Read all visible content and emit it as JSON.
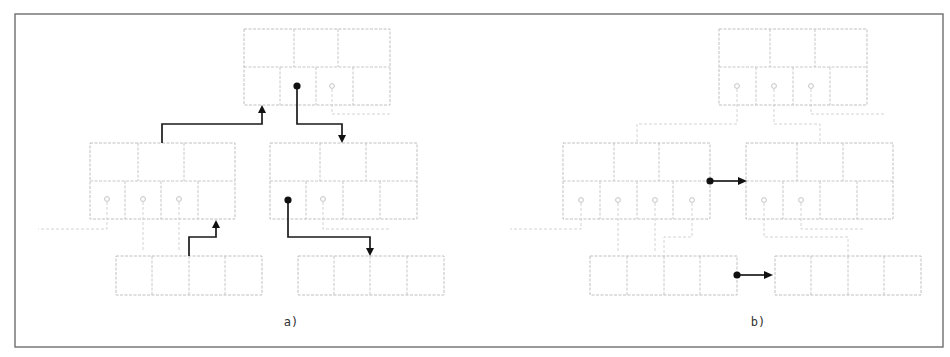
{
  "figure": {
    "width": 950,
    "height": 357,
    "frame": {
      "x": 15,
      "y": 14,
      "w": 928,
      "h": 333
    },
    "colors": {
      "frame": "#6e6e6e",
      "node_border": "#b9b9b9",
      "faint_pointer": "#cfcfcf",
      "bold_pointer": "#111111",
      "caption": "#333333"
    }
  },
  "panels": [
    {
      "id": "a",
      "caption": "a)",
      "caption_pos": {
        "x": 291,
        "y": 326
      },
      "nodes": [
        {
          "id": "a-root",
          "type": "internal",
          "x": 244,
          "y": 29,
          "w": 146,
          "h": 76,
          "split_y": 67,
          "key_splits": [
            294,
            338
          ],
          "ptr_splits": [
            280,
            316,
            353
          ]
        },
        {
          "id": "a-left",
          "type": "internal",
          "x": 90,
          "y": 143,
          "w": 145,
          "h": 76,
          "split_y": 181,
          "key_splits": [
            138,
            184
          ],
          "ptr_splits": [
            125,
            161,
            198
          ]
        },
        {
          "id": "a-right",
          "type": "internal",
          "x": 270,
          "y": 143,
          "w": 147,
          "h": 76,
          "split_y": 181,
          "key_splits": [
            320,
            366
          ],
          "ptr_splits": [
            306,
            343,
            380
          ]
        },
        {
          "id": "a-leaf-1",
          "type": "leaf",
          "x": 116,
          "y": 256,
          "w": 146,
          "h": 39,
          "splits": [
            152,
            189,
            225
          ]
        },
        {
          "id": "a-leaf-2",
          "type": "leaf",
          "x": 298,
          "y": 256,
          "w": 146,
          "h": 39,
          "splits": [
            334,
            370,
            407
          ]
        }
      ],
      "faint_dots": [
        {
          "x": 332,
          "y": 86
        },
        {
          "x": 107,
          "y": 199
        },
        {
          "x": 143,
          "y": 199
        },
        {
          "x": 179,
          "y": 199
        },
        {
          "x": 323,
          "y": 199
        }
      ],
      "faint_paths": [
        "M332 89 L332 114 L392 114",
        "M107 202 L107 229 L38 229",
        "M143 202 L143 252",
        "M179 202 L179 252",
        "M323 202 L323 229 L390 229"
      ],
      "bold_dots": [
        {
          "x": 297,
          "y": 86
        },
        {
          "x": 288,
          "y": 200
        }
      ],
      "bold_arrows": [
        {
          "path": "M162 143 L162 124 L262 124 L262 111",
          "head": {
            "x": 262,
            "y": 105,
            "dir": "up"
          }
        },
        {
          "path": "M297 86 L297 124 L342 124 L342 137",
          "head": {
            "x": 342,
            "y": 143,
            "dir": "down"
          }
        },
        {
          "path": "M189 256 L189 237 L216 237 L216 226",
          "head": {
            "x": 216,
            "y": 220,
            "dir": "up"
          }
        },
        {
          "path": "M288 200 L288 237 L370 237 L370 250",
          "head": {
            "x": 370,
            "y": 256,
            "dir": "down"
          }
        }
      ]
    },
    {
      "id": "b",
      "caption": "b)",
      "caption_pos": {
        "x": 758,
        "y": 326
      },
      "nodes": [
        {
          "id": "b-root",
          "type": "internal",
          "x": 719,
          "y": 29,
          "w": 148,
          "h": 76,
          "split_y": 67,
          "key_splits": [
            770,
            815
          ],
          "ptr_splits": [
            756,
            793,
            830
          ]
        },
        {
          "id": "b-left",
          "type": "internal",
          "x": 563,
          "y": 143,
          "w": 147,
          "h": 76,
          "split_y": 181,
          "key_splits": [
            614,
            659
          ],
          "ptr_splits": [
            600,
            637,
            673
          ]
        },
        {
          "id": "b-right",
          "type": "internal",
          "x": 746,
          "y": 143,
          "w": 147,
          "h": 76,
          "split_y": 181,
          "key_splits": [
            797,
            843
          ],
          "ptr_splits": [
            783,
            820,
            857
          ]
        },
        {
          "id": "b-leaf-1",
          "type": "leaf",
          "x": 590,
          "y": 256,
          "w": 147,
          "h": 39,
          "splits": [
            627,
            664,
            700
          ]
        },
        {
          "id": "b-leaf-2",
          "type": "leaf",
          "x": 775,
          "y": 256,
          "w": 146,
          "h": 39,
          "splits": [
            811,
            848,
            884
          ]
        }
      ],
      "faint_dots": [
        {
          "x": 737,
          "y": 86
        },
        {
          "x": 774,
          "y": 86
        },
        {
          "x": 811,
          "y": 86
        },
        {
          "x": 581,
          "y": 200
        },
        {
          "x": 618,
          "y": 200
        },
        {
          "x": 655,
          "y": 200
        },
        {
          "x": 692,
          "y": 200
        },
        {
          "x": 764,
          "y": 200
        },
        {
          "x": 801,
          "y": 200
        }
      ],
      "faint_paths": [
        "M737 89 L737 124 L637 124 L637 143",
        "M774 89 L774 124 L820 124 L820 143",
        "M811 89 L811 114 L885 114",
        "M581 203 L581 229 L510 229",
        "M618 203 L618 252",
        "M655 203 L655 252",
        "M692 203 L692 237 L664 237 L664 256",
        "M764 203 L764 237 L848 237 L848 256",
        "M801 203 L801 229 L865 229"
      ],
      "bold_dots": [
        {
          "x": 710,
          "y": 181
        },
        {
          "x": 737,
          "y": 275
        }
      ],
      "bold_arrows": [
        {
          "path": "M710 181 L741 181",
          "head": {
            "x": 747,
            "y": 181,
            "dir": "right"
          }
        },
        {
          "path": "M737 275 L766 275",
          "head": {
            "x": 773,
            "y": 275,
            "dir": "right"
          }
        }
      ]
    }
  ]
}
